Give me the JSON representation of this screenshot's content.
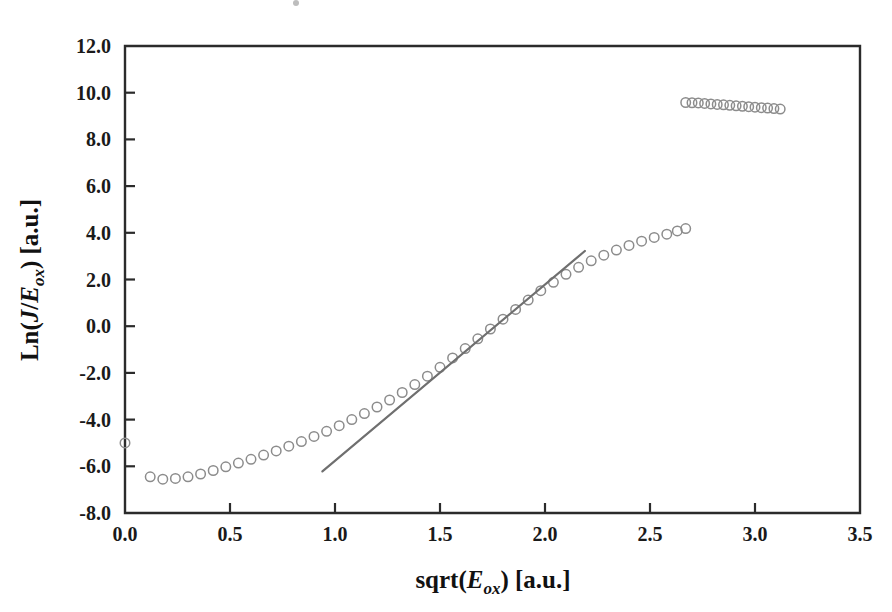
{
  "figure": {
    "background_color": "#ffffff",
    "axis_color": "#2b2b2b",
    "marker_color": "#8c8c8c",
    "fit_line_color": "#6f6f6f"
  },
  "axes": {
    "x_title_parts": {
      "pre": "sqrt(",
      "italic": "E",
      "sub": "ox",
      "post": ") [a.u.]"
    },
    "y_title_parts": {
      "pre": "Ln(",
      "italic1": "J",
      "slash": "/",
      "italic2": "E",
      "sub": "ox",
      "post": ") [a.u.]"
    },
    "x_tick_labels": [
      "0.0",
      "0.5",
      "1.0",
      "1.5",
      "2.0",
      "2.5",
      "3.0",
      "3.5"
    ],
    "y_tick_labels": [
      "12.0",
      "10.0",
      "8.0",
      "6.0",
      "4.0",
      "2.0",
      "0.0",
      "-2.0",
      "-4.0",
      "-6.0",
      "-8.0"
    ]
  },
  "chart_data": {
    "type": "scatter",
    "title": "",
    "xlabel": "sqrt(E_ox) [a.u.]",
    "ylabel": "Ln(J/E_ox) [a.u.]",
    "xlim": [
      0.0,
      3.5
    ],
    "ylim": [
      -8.0,
      12.0
    ],
    "xticks": [
      0.0,
      0.5,
      1.0,
      1.5,
      2.0,
      2.5,
      3.0,
      3.5
    ],
    "yticks": [
      -8.0,
      -6.0,
      -4.0,
      -2.0,
      0.0,
      2.0,
      4.0,
      6.0,
      8.0,
      10.0,
      12.0
    ],
    "grid": false,
    "legend": null,
    "marker_style": "open-circle",
    "marker_size_px": 9.5,
    "series": [
      {
        "name": "main-branch",
        "marker": "open-circle",
        "x": [
          0.0,
          0.12,
          0.18,
          0.24,
          0.3,
          0.36,
          0.42,
          0.48,
          0.54,
          0.6,
          0.66,
          0.72,
          0.78,
          0.84,
          0.9,
          0.96,
          1.02,
          1.08,
          1.14,
          1.2,
          1.26,
          1.32,
          1.38,
          1.44,
          1.5,
          1.56,
          1.62,
          1.68,
          1.74,
          1.8,
          1.86,
          1.92,
          1.98,
          2.04,
          2.1,
          2.16,
          2.22,
          2.28,
          2.34,
          2.4,
          2.46,
          2.52,
          2.58,
          2.63,
          2.67
        ],
        "y": [
          -5.0,
          -6.45,
          -6.55,
          -6.52,
          -6.45,
          -6.33,
          -6.18,
          -6.02,
          -5.86,
          -5.7,
          -5.52,
          -5.34,
          -5.14,
          -4.94,
          -4.72,
          -4.5,
          -4.26,
          -4.0,
          -3.74,
          -3.46,
          -3.16,
          -2.84,
          -2.5,
          -2.14,
          -1.76,
          -1.36,
          -0.96,
          -0.54,
          -0.12,
          0.3,
          0.72,
          1.12,
          1.52,
          1.88,
          2.22,
          2.52,
          2.8,
          3.04,
          3.26,
          3.46,
          3.64,
          3.8,
          3.94,
          4.08,
          4.18
        ]
      },
      {
        "name": "upper-branch",
        "marker": "open-circle",
        "x": [
          2.67,
          2.7,
          2.73,
          2.76,
          2.79,
          2.82,
          2.85,
          2.88,
          2.91,
          2.94,
          2.97,
          3.0,
          3.03,
          3.06,
          3.09,
          3.12
        ],
        "y": [
          9.58,
          9.57,
          9.56,
          9.54,
          9.52,
          9.5,
          9.48,
          9.46,
          9.44,
          9.42,
          9.4,
          9.38,
          9.36,
          9.34,
          9.32,
          9.3
        ]
      }
    ],
    "annotations": [
      {
        "type": "fit-line",
        "name": "tangent-fit-line",
        "x0": 0.94,
        "y0": -6.22,
        "x1": 2.19,
        "y1": 3.22
      }
    ]
  }
}
